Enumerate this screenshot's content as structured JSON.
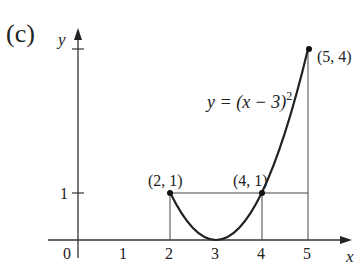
{
  "figure": {
    "panel_label": "(c)",
    "axes": {
      "x_label": "x",
      "y_label": "y",
      "origin_label": "0",
      "x_ticks": [
        "1",
        "2",
        "3",
        "4",
        "5"
      ],
      "y_ticks": [
        "1"
      ]
    },
    "equation": {
      "lhs": "y = (x − 3)",
      "exponent": "2"
    },
    "points": [
      {
        "label": "(2, 1)",
        "x": 2,
        "y": 1
      },
      {
        "label": "(4, 1)",
        "x": 4,
        "y": 1
      },
      {
        "label": "(5, 4)",
        "x": 5,
        "y": 4
      }
    ],
    "colors": {
      "ink": "#222222",
      "background": "#ffffff"
    }
  }
}
